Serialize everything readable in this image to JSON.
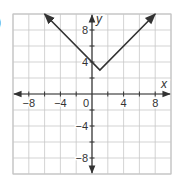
{
  "problem_label": ")",
  "chart_data": {
    "type": "line",
    "title": "",
    "xlabel": "x",
    "ylabel": "y",
    "xlim": [
      -10,
      10
    ],
    "ylim": [
      -10,
      10
    ],
    "grid": true,
    "x_ticks": [
      -8,
      -4,
      0,
      4,
      8
    ],
    "y_ticks": [
      8,
      4,
      -4,
      -8
    ],
    "x_tick_labels": [
      "−8",
      "−4",
      "0",
      "4",
      "8"
    ],
    "y_tick_labels": [
      "8",
      "4",
      "−4",
      "−8"
    ],
    "series": [
      {
        "name": "y = |x − 1| + 3",
        "x": [
          -6,
          1,
          8
        ],
        "y": [
          10,
          3,
          10
        ],
        "arrows_both_ends": true
      }
    ],
    "vertex": [
      1,
      3
    ],
    "colors": {
      "line": "#333333",
      "grid": "#c8c8c8",
      "axis": "#333333"
    }
  }
}
